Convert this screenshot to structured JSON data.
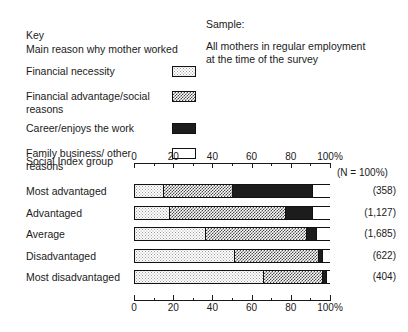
{
  "key": {
    "heading": "Key",
    "subheading": "Main reason why mother worked",
    "items": [
      {
        "label": "Financial necessity",
        "pattern": "light-stipple"
      },
      {
        "label": "Financial advantage/social reasons",
        "pattern": "medium-checker"
      },
      {
        "label": "Career/enjoys the work",
        "pattern": "solid-black"
      },
      {
        "label": "Family business/ other reasons",
        "pattern": "white"
      }
    ]
  },
  "sample": {
    "heading": "Sample:",
    "line1": "All mothers in regular employment",
    "line2": "at the time of the survey"
  },
  "chart_data": {
    "type": "bar",
    "orientation": "horizontal",
    "stacked": true,
    "normalized_percent": true,
    "title": "",
    "xlabel": "100%",
    "ylabel": "Social Index group",
    "axis_title": "Social Index group",
    "n_note": "(N = 100%)",
    "xlim": [
      0,
      100
    ],
    "xticks": [
      0,
      20,
      40,
      60,
      80,
      100
    ],
    "xticklabels": [
      "0",
      "20",
      "40",
      "60",
      "80",
      "100%"
    ],
    "minor_xticks": [
      10,
      30,
      50,
      70,
      90
    ],
    "grid": false,
    "legend_position": "top-left-key-box",
    "categories": [
      "Most advantaged",
      "Advantaged",
      "Average",
      "Disadvantaged",
      "Most disadvantaged"
    ],
    "n_values": [
      "(358)",
      "(1,127)",
      "(1,685)",
      "(622)",
      "(404)"
    ],
    "series": [
      {
        "name": "Financial necessity",
        "pattern": "light-stipple",
        "values": [
          15,
          18,
          36,
          51,
          66
        ]
      },
      {
        "name": "Financial advantage/social reasons",
        "pattern": "medium-checker",
        "values": [
          35,
          59,
          52,
          43,
          30
        ]
      },
      {
        "name": "Career/enjoys the work",
        "pattern": "solid-black",
        "values": [
          41,
          14,
          5,
          2,
          2
        ]
      },
      {
        "name": "Family business/ other reasons",
        "pattern": "white",
        "values": [
          9,
          9,
          7,
          4,
          2
        ]
      }
    ],
    "bottom_axis": {
      "xticks": [
        0,
        20,
        40,
        60,
        80,
        100
      ],
      "xticklabels": [
        "0",
        "20",
        "40",
        "60",
        "80",
        "100%"
      ],
      "minor_xticks": [
        10,
        30,
        50,
        70,
        90
      ]
    }
  }
}
